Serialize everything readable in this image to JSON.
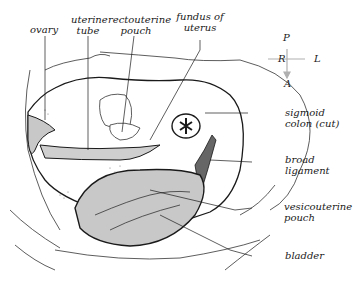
{
  "diagram": {
    "type": "anatomical-illustration",
    "labels": [
      {
        "id": "ovary",
        "text": "ovary"
      },
      {
        "id": "uterine-tube",
        "line1": "uterine",
        "line2": "tube"
      },
      {
        "id": "rectouterine-pouch",
        "line1": "rectouterine",
        "line2": "pouch"
      },
      {
        "id": "fundus-of-uterus",
        "line1": "fundus of",
        "line2": "uterus"
      },
      {
        "id": "sigmoid-colon",
        "line1": "sigmoid",
        "line2": "colon (cut)"
      },
      {
        "id": "broad-ligament",
        "line1": "broad",
        "line2": "ligament"
      },
      {
        "id": "vesicouterine-pouch",
        "line1": "vesicouterine",
        "line2": "pouch"
      },
      {
        "id": "bladder",
        "text": "bladder"
      }
    ],
    "orientation": {
      "top": "P",
      "left": "R",
      "right": "L",
      "bottom": "A"
    },
    "colors": {
      "line": "#1a1a1a",
      "shade": "#c8c8c8",
      "arrow": "#b0b0b0"
    }
  }
}
